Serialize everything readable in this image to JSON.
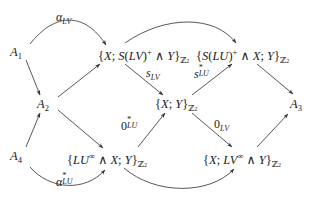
{
  "diagram": {
    "type": "commutative-diagram",
    "nodes": {
      "a1": {
        "base": "A",
        "sub": "1"
      },
      "a2": {
        "base": "A",
        "sub": "2"
      },
      "a3": {
        "base": "A",
        "sub": "3"
      },
      "a4": {
        "base": "A",
        "sub": "4"
      },
      "top_mid": {
        "open": "{",
        "x": "X",
        "sep": "; ",
        "s": "S",
        "lp": "(",
        "lv": "LV",
        "rp": ")",
        "plus": "+",
        "wedge": " ∧ ",
        "y": "Y",
        "close": "}",
        "z": "ℤ",
        "z2": "2"
      },
      "top_right": {
        "open": "{",
        "s": "S",
        "lp": "(",
        "lu": "LU",
        "rp": ")",
        "plus": "+",
        "wedge": " ∧ ",
        "x": "X",
        "sep": "; ",
        "y": "Y",
        "close": "}",
        "z": "ℤ",
        "z2": "2"
      },
      "center": {
        "open": "{",
        "x": "X",
        "sep": "; ",
        "y": "Y",
        "close": "}",
        "z": "ℤ",
        "z2": "2"
      },
      "bottom_mid": {
        "open": "{",
        "lu": "LU",
        "inf": "∞",
        "wedge": " ∧ ",
        "x": "X",
        "sep": "; ",
        "y": "Y",
        "close": "}",
        "z": "ℤ",
        "z2": "2"
      },
      "bottom_right": {
        "open": "{",
        "x": "X",
        "sep": "; ",
        "lv": "LV",
        "inf": "∞",
        "wedge": " ∧ ",
        "y": "Y",
        "close": "}",
        "z": "ℤ",
        "z2": "2"
      }
    },
    "labels": {
      "alpha_lv": {
        "base": "α",
        "sub": "LV"
      },
      "s_lv": {
        "base": "s",
        "sub": "LV"
      },
      "s_lu_star": {
        "base": "s",
        "sup": "*",
        "sub": "LU"
      },
      "zero_lu_star": {
        "base": "0",
        "sup": "*",
        "sub": "LU"
      },
      "zero_lv": {
        "base": "0",
        "sub": "LV"
      },
      "alpha_lu_star": {
        "base": "α",
        "sup": "*",
        "sub": "LU"
      }
    },
    "arrows": [
      {
        "from": "A1",
        "to": "{X; S(LV)+ ∧ Y}Z2",
        "label": "α_LV",
        "style": "curved"
      },
      {
        "from": "A1",
        "to": "A2",
        "style": "straight"
      },
      {
        "from": "A4",
        "to": "A2",
        "style": "straight"
      },
      {
        "from": "A2",
        "to": "{X; S(LV)+ ∧ Y}Z2",
        "style": "straight"
      },
      {
        "from": "A2",
        "to": "{LU∞ ∧ X; Y}Z2",
        "style": "straight"
      },
      {
        "from": "{X; S(LV)+ ∧ Y}Z2",
        "to": "{S(LU)+ ∧ X; Y}Z2",
        "style": "curved"
      },
      {
        "from": "{X; S(LV)+ ∧ Y}Z2",
        "to": "{X; Y}Z2",
        "label": "s_LV",
        "style": "straight"
      },
      {
        "from": "{X; Y}Z2",
        "to": "{S(LU)+ ∧ X; Y}Z2",
        "label": "s*_LU",
        "style": "straight"
      },
      {
        "from": "{LU∞ ∧ X; Y}Z2",
        "to": "{X; Y}Z2",
        "label": "0*_LU",
        "style": "straight"
      },
      {
        "from": "{X; Y}Z2",
        "to": "{X; LV∞ ∧ Y}Z2",
        "label": "0_LV",
        "style": "straight"
      },
      {
        "from": "{S(LU)+ ∧ X; Y}Z2",
        "to": "A3",
        "style": "straight"
      },
      {
        "from": "{X; LV∞ ∧ Y}Z2",
        "to": "A3",
        "style": "straight"
      },
      {
        "from": "A4",
        "to": "{LU∞ ∧ X; Y}Z2",
        "label": "α*_LU",
        "style": "curved"
      },
      {
        "from": "{LU∞ ∧ X; Y}Z2",
        "to": "{X; LV∞ ∧ Y}Z2",
        "style": "curved"
      }
    ],
    "colors": {
      "ink": "#222222",
      "background": "#ffffff"
    }
  }
}
